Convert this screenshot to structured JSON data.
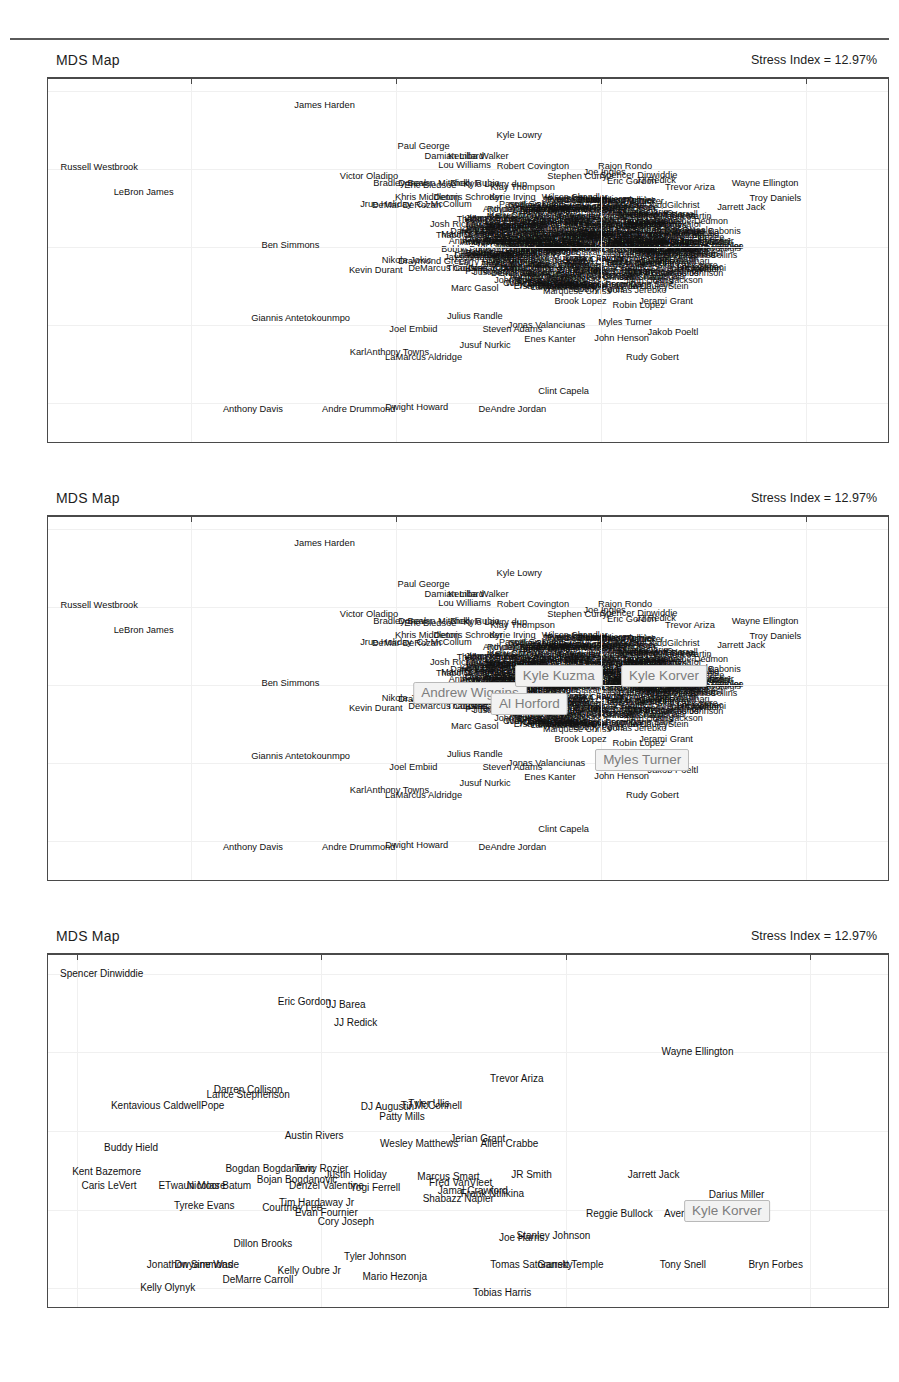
{
  "figure": {
    "panel_title": "MDS Map",
    "stress_label": "Stress Index = 12.97%"
  },
  "chart_data": [
    {
      "type": "scatter",
      "id": "panel-1",
      "title": "MDS Map",
      "annotation": "Stress Index = 12.97%",
      "xlabel": "",
      "ylabel": "",
      "xlim": [
        -8.1,
        4.2
      ],
      "ylim": [
        -5.0,
        4.3
      ],
      "xticks": [
        -6,
        -3,
        0,
        3
      ],
      "yticks": [
        4,
        2,
        0,
        -2,
        -4
      ],
      "grid": true,
      "legend": "none",
      "points": [
        {
          "label": "James Harden",
          "x": -4.05,
          "y": 3.6
        },
        {
          "label": "Kyle Lowry",
          "x": -1.2,
          "y": 2.85
        },
        {
          "label": "Paul George",
          "x": -2.6,
          "y": 2.55
        },
        {
          "label": "Damian Lillard",
          "x": -2.15,
          "y": 2.3
        },
        {
          "label": "Kemba Walker",
          "x": -1.8,
          "y": 2.3
        },
        {
          "label": "Lou Williams",
          "x": -2.0,
          "y": 2.08
        },
        {
          "label": "Robert Covington",
          "x": -1.0,
          "y": 2.05
        },
        {
          "label": "Rajon Rondo",
          "x": 0.35,
          "y": 2.05
        },
        {
          "label": "Russell Westbrook",
          "x": -7.35,
          "y": 2.02
        },
        {
          "label": "Joe Ingles",
          "x": 0.05,
          "y": 1.88
        },
        {
          "label": "Spencer Dinwiddie",
          "x": 0.55,
          "y": 1.82
        },
        {
          "label": "Stephen Curry",
          "x": -0.35,
          "y": 1.8
        },
        {
          "label": "Victor Oladipo",
          "x": -3.4,
          "y": 1.78
        },
        {
          "label": "Eric Gordon",
          "x": 0.45,
          "y": 1.65
        },
        {
          "label": "JJ Redick",
          "x": 0.8,
          "y": 1.68
        },
        {
          "label": "Wayne Ellington",
          "x": 2.4,
          "y": 1.62
        },
        {
          "label": "Bradley Beal",
          "x": -2.95,
          "y": 1.6
        },
        {
          "label": "Donovan Mitchell",
          "x": -2.45,
          "y": 1.62
        },
        {
          "label": "Eric Bledsoe",
          "x": -2.5,
          "y": 1.55
        },
        {
          "label": "Ricky Rubio",
          "x": -1.85,
          "y": 1.6
        },
        {
          "label": "Kyle Lowry dup",
          "x": -1.55,
          "y": 1.58
        },
        {
          "label": "Klay Thompson",
          "x": -1.15,
          "y": 1.52
        },
        {
          "label": "Trevor Ariza",
          "x": 1.3,
          "y": 1.52
        },
        {
          "label": "LeBron James",
          "x": -6.7,
          "y": 1.38
        },
        {
          "label": "Khris Middleton",
          "x": -2.55,
          "y": 1.25
        },
        {
          "label": "Dennis Schroder",
          "x": -1.95,
          "y": 1.24
        },
        {
          "label": "Kyrie Irving",
          "x": -1.3,
          "y": 1.24
        },
        {
          "label": "Troy Daniels",
          "x": 2.55,
          "y": 1.22
        },
        {
          "label": "Jrue Holiday",
          "x": -3.15,
          "y": 1.08
        },
        {
          "label": "DeMar DeRozan",
          "x": -2.85,
          "y": 1.05
        },
        {
          "label": "CJ McCollum",
          "x": -2.3,
          "y": 1.08
        },
        {
          "label": "Jarrett Jack",
          "x": 2.05,
          "y": 1.0
        },
        {
          "label": "Jimmy Butler",
          "x": -1.6,
          "y": 0.72
        },
        {
          "label": "Josh Richardson",
          "x": -2.0,
          "y": 0.55
        },
        {
          "label": "Otto Porter Jr",
          "x": -1.35,
          "y": 0.35
        },
        {
          "label": "Andrew Wiggins",
          "x": -1.55,
          "y": 0.1
        },
        {
          "label": "Kyle Kuzma",
          "x": -0.75,
          "y": 0.12
        },
        {
          "label": "Kyle Korver",
          "x": 0.7,
          "y": 0.12
        },
        {
          "label": "Ben Simmons",
          "x": -4.55,
          "y": 0.02
        },
        {
          "label": "Harrison Barnes",
          "x": -1.45,
          "y": -0.18
        },
        {
          "label": "Nikola Jokic",
          "x": -2.85,
          "y": -0.35
        },
        {
          "label": "Draymond Green",
          "x": -2.45,
          "y": -0.38
        },
        {
          "label": "DeMarcus Cousins",
          "x": -2.25,
          "y": -0.58
        },
        {
          "label": "Thaddeus Young",
          "x": -1.75,
          "y": -0.58
        },
        {
          "label": "Kevin Durant",
          "x": -3.3,
          "y": -0.62
        },
        {
          "label": "Al Horford",
          "x": -1.3,
          "y": -0.4
        },
        {
          "label": "Marc Gasol",
          "x": -1.85,
          "y": -1.08
        },
        {
          "label": "Giannis Antetokounmpo",
          "x": -4.4,
          "y": -1.85
        },
        {
          "label": "Julius Randle",
          "x": -1.85,
          "y": -1.8
        },
        {
          "label": "Brook Lopez",
          "x": -0.3,
          "y": -1.42
        },
        {
          "label": "Robin Lopez",
          "x": 0.55,
          "y": -1.52
        },
        {
          "label": "Jerami Grant",
          "x": 0.95,
          "y": -1.42
        },
        {
          "label": "Myles Turner",
          "x": 0.35,
          "y": -1.95
        },
        {
          "label": "Joel Embiid",
          "x": -2.75,
          "y": -2.12
        },
        {
          "label": "Steven Adams",
          "x": -1.3,
          "y": -2.12
        },
        {
          "label": "Jonas Valanciunas",
          "x": -0.8,
          "y": -2.02
        },
        {
          "label": "Enes Kanter",
          "x": -0.75,
          "y": -2.38
        },
        {
          "label": "John Henson",
          "x": 0.3,
          "y": -2.35
        },
        {
          "label": "Jakob Poeltl",
          "x": 1.05,
          "y": -2.2
        },
        {
          "label": "KarlAnthony Towns",
          "x": -3.1,
          "y": -2.72
        },
        {
          "label": "Jusuf Nurkic",
          "x": -1.7,
          "y": -2.55
        },
        {
          "label": "LaMarcus Aldridge",
          "x": -2.6,
          "y": -2.85
        },
        {
          "label": "Rudy Gobert",
          "x": 0.75,
          "y": -2.85
        },
        {
          "label": "Clint Capela",
          "x": -0.55,
          "y": -3.72
        },
        {
          "label": "Anthony Davis",
          "x": -5.1,
          "y": -4.18
        },
        {
          "label": "Andre Drummond",
          "x": -3.55,
          "y": -4.18
        },
        {
          "label": "Dwight Howard",
          "x": -2.7,
          "y": -4.12
        },
        {
          "label": "DeAndre Jordan",
          "x": -1.3,
          "y": -4.18
        }
      ]
    },
    {
      "type": "scatter",
      "id": "panel-2",
      "title": "MDS Map",
      "annotation": "Stress Index = 12.97%",
      "xlim": [
        -8.1,
        4.2
      ],
      "ylim": [
        -5.0,
        4.3
      ],
      "xticks": [
        -6,
        -3,
        0,
        3
      ],
      "yticks": [
        4,
        2,
        0,
        -2,
        -4
      ],
      "grid": true,
      "highlighted": [
        {
          "label": "Andrew Wiggins",
          "x": -1.92,
          "y": -0.22
        },
        {
          "label": "Kyle Kuzma",
          "x": -0.62,
          "y": 0.22
        },
        {
          "label": "Kyle Korver",
          "x": 0.92,
          "y": 0.22
        },
        {
          "label": "Al Horford",
          "x": -1.05,
          "y": -0.48
        },
        {
          "label": "Myles Turner",
          "x": 0.6,
          "y": -1.92
        }
      ]
    },
    {
      "type": "scatter",
      "id": "panel-3",
      "title": "MDS Map",
      "annotation": "Stress Index = 12.97%",
      "xlim": [
        -0.12,
        3.32
      ],
      "ylim": [
        -0.12,
        2.12
      ],
      "xticks": [
        0,
        1,
        2,
        3
      ],
      "yticks": [
        2.0,
        1.5,
        1.0,
        0.5,
        0.0
      ],
      "grid": true,
      "highlighted": [
        {
          "label": "Kyle Korver",
          "x": 2.66,
          "y": 0.49
        }
      ],
      "points": [
        {
          "label": "Spencer Dinwiddie",
          "x": 0.1,
          "y": 2.0
        },
        {
          "label": "Eric Gordon",
          "x": 0.93,
          "y": 1.82
        },
        {
          "label": "JJ Barea",
          "x": 1.1,
          "y": 1.8
        },
        {
          "label": "JJ Redick",
          "x": 1.14,
          "y": 1.69
        },
        {
          "label": "Wayne Ellington",
          "x": 2.54,
          "y": 1.5
        },
        {
          "label": "Trevor Ariza",
          "x": 1.8,
          "y": 1.33
        },
        {
          "label": "Darren Collison",
          "x": 0.7,
          "y": 1.26
        },
        {
          "label": "Lance Stephenson",
          "x": 0.7,
          "y": 1.23
        },
        {
          "label": "Kentavious CaldwellPope",
          "x": 0.37,
          "y": 1.16
        },
        {
          "label": "DJ Augustin",
          "x": 1.27,
          "y": 1.15
        },
        {
          "label": "TJ McConnell",
          "x": 1.45,
          "y": 1.16
        },
        {
          "label": "Tyler Ulis",
          "x": 1.44,
          "y": 1.17
        },
        {
          "label": "Patty Mills",
          "x": 1.33,
          "y": 1.09
        },
        {
          "label": "Austin Rivers",
          "x": 0.97,
          "y": 0.97
        },
        {
          "label": "Jerian Grant",
          "x": 1.64,
          "y": 0.95
        },
        {
          "label": "Wesley Matthews",
          "x": 1.4,
          "y": 0.92
        },
        {
          "label": "Allen Crabbe",
          "x": 1.77,
          "y": 0.92
        },
        {
          "label": "Buddy Hield",
          "x": 0.22,
          "y": 0.89
        },
        {
          "label": "Bogdan Bogdanovic",
          "x": 0.79,
          "y": 0.76
        },
        {
          "label": "Terry Rozier",
          "x": 1.0,
          "y": 0.76
        },
        {
          "label": "Justin Holiday",
          "x": 1.14,
          "y": 0.72
        },
        {
          "label": "Marcus Smart",
          "x": 1.52,
          "y": 0.71
        },
        {
          "label": "JR Smith",
          "x": 1.86,
          "y": 0.72
        },
        {
          "label": "Jarrett Jack",
          "x": 2.36,
          "y": 0.72
        },
        {
          "label": "Kent Bazemore",
          "x": 0.12,
          "y": 0.74
        },
        {
          "label": "Bojan Bogdanovic",
          "x": 0.9,
          "y": 0.69
        },
        {
          "label": "Fred VanVleet",
          "x": 1.57,
          "y": 0.67
        },
        {
          "label": "Caris LeVert",
          "x": 0.13,
          "y": 0.65
        },
        {
          "label": "ETwaun Moore",
          "x": 0.47,
          "y": 0.65
        },
        {
          "label": "Nicolas Batum",
          "x": 0.58,
          "y": 0.65
        },
        {
          "label": "Denzel Valentine",
          "x": 1.02,
          "y": 0.65
        },
        {
          "label": "Yogi Ferrell",
          "x": 1.22,
          "y": 0.64
        },
        {
          "label": "Jamal Crawford",
          "x": 1.62,
          "y": 0.62
        },
        {
          "label": "Frank Ntilikina",
          "x": 1.7,
          "y": 0.6
        },
        {
          "label": "Darius Miller",
          "x": 2.7,
          "y": 0.59
        },
        {
          "label": "Shabazz Napier",
          "x": 1.56,
          "y": 0.57
        },
        {
          "label": "Tyreke Evans",
          "x": 0.52,
          "y": 0.52
        },
        {
          "label": "Tim Hardaway Jr",
          "x": 0.98,
          "y": 0.54
        },
        {
          "label": "Courtney Lee",
          "x": 0.88,
          "y": 0.51
        },
        {
          "label": "Evan Fournier",
          "x": 1.02,
          "y": 0.48
        },
        {
          "label": "Reggie Bullock",
          "x": 2.22,
          "y": 0.47
        },
        {
          "label": "Avery Bradley",
          "x": 2.53,
          "y": 0.47
        },
        {
          "label": "Cory Joseph",
          "x": 1.1,
          "y": 0.42
        },
        {
          "label": "Dillon Brooks",
          "x": 0.76,
          "y": 0.28
        },
        {
          "label": "Joe Harris",
          "x": 1.82,
          "y": 0.32
        },
        {
          "label": "Stanley Johnson",
          "x": 1.95,
          "y": 0.33
        },
        {
          "label": "Tyler Johnson",
          "x": 1.22,
          "y": 0.2
        },
        {
          "label": "Jonathon Simmons",
          "x": 0.46,
          "y": 0.15
        },
        {
          "label": "Dwyane Wade",
          "x": 0.53,
          "y": 0.15
        },
        {
          "label": "Tomas Satoransky",
          "x": 1.86,
          "y": 0.15
        },
        {
          "label": "Garrett Temple",
          "x": 2.02,
          "y": 0.15
        },
        {
          "label": "Tony Snell",
          "x": 2.48,
          "y": 0.15
        },
        {
          "label": "Bryn Forbes",
          "x": 2.86,
          "y": 0.15
        },
        {
          "label": "Kelly Oubre Jr",
          "x": 0.95,
          "y": 0.11
        },
        {
          "label": "Mario Hezonja",
          "x": 1.3,
          "y": 0.07
        },
        {
          "label": "DeMarre Carroll",
          "x": 0.74,
          "y": 0.05
        },
        {
          "label": "Kelly Olynyk",
          "x": 0.37,
          "y": 0.0
        },
        {
          "label": "Tobias Harris",
          "x": 1.74,
          "y": -0.03
        }
      ]
    }
  ]
}
